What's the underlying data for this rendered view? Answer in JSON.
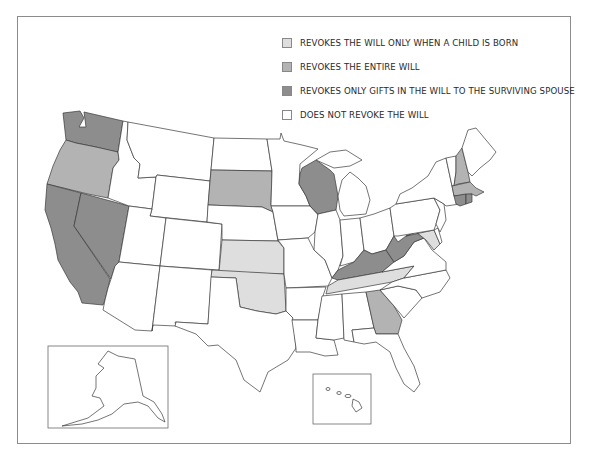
{
  "legend": {
    "items": [
      {
        "key": "child_born",
        "label": "REVOKES THE WILL ONLY WHEN A CHILD IS BORN",
        "color": "#dedede"
      },
      {
        "key": "entire",
        "label": "REVOKES THE ENTIRE WILL",
        "color": "#b3b3b3"
      },
      {
        "key": "spouse_gifts",
        "label": "REVOKES ONLY GIFTS IN THE WILL TO THE SURVIVING SPOUSE",
        "color": "#8d8d8d"
      },
      {
        "key": "none",
        "label": "DOES NOT REVOKE THE WILL",
        "color": "#ffffff"
      }
    ]
  },
  "states": {
    "WA": "spouse_gifts",
    "OR": "entire",
    "CA": "spouse_gifts",
    "NV": "spouse_gifts",
    "ID": "none",
    "MT": "none",
    "WY": "none",
    "UT": "none",
    "AZ": "none",
    "CO": "none",
    "NM": "none",
    "ND": "none",
    "SD": "entire",
    "NE": "none",
    "KS": "child_born",
    "OK": "child_born",
    "TX": "none",
    "MN": "none",
    "IA": "none",
    "MO": "none",
    "AR": "none",
    "LA": "none",
    "WI": "spouse_gifts",
    "IL": "none",
    "MI": "none",
    "IN": "none",
    "OH": "none",
    "KY": "spouse_gifts",
    "TN": "child_born",
    "MS": "none",
    "AL": "none",
    "GA": "entire",
    "FL": "none",
    "SC": "none",
    "NC": "none",
    "VA": "none",
    "WV": "spouse_gifts",
    "MD": "child_born",
    "DE": "none",
    "PA": "none",
    "NJ": "none",
    "NY": "none",
    "CT": "spouse_gifts",
    "RI": "spouse_gifts",
    "MA": "entire",
    "VT": "none",
    "NH": "entire",
    "ME": "none",
    "AK": "none",
    "HI": "none"
  }
}
